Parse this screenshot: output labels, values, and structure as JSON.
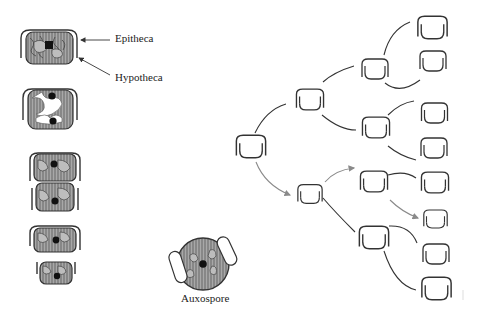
{
  "diagram": {
    "labels": {
      "epitheca": "Epitheca",
      "hypotheca": "Hypotheca",
      "auxospore": "Auxospore"
    },
    "colors": {
      "outline": "#333333",
      "fill": "#9a9a9a",
      "arrow_gray": "#8a8a8a",
      "line_dark": "#333333"
    },
    "division_stages": [
      {
        "name": "interphase-cell"
      },
      {
        "name": "dividing-cell"
      },
      {
        "name": "daughter-cells-separating"
      },
      {
        "name": "daughter-cells-separated"
      }
    ],
    "tree": {
      "generations": 4,
      "note": "Successive divisions; gray arrows trace the lineage of diminishing cell size"
    }
  }
}
